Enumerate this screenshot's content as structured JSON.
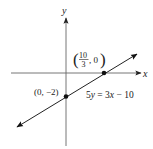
{
  "figure": {
    "type": "coordinate-plane-line-graph",
    "axes": {
      "x_label": "x",
      "y_label": "y"
    },
    "line": {
      "equation": "5y = 3x − 10",
      "equation_parts": {
        "lhs_coef": "5",
        "lhs_var": "y",
        "eq": " = ",
        "rhs_coef": "3",
        "rhs_var": "x",
        "rhs_rest": " − 10"
      },
      "slope": "3/5",
      "arrows": "both-ends"
    },
    "points": [
      {
        "name": "x-intercept",
        "label": "(10/3, 0)",
        "fraction_numerator": "10",
        "fraction_denominator": "3",
        "label_suffix": ", 0"
      },
      {
        "name": "y-intercept",
        "label": "(0, −2)"
      }
    ],
    "colors": {
      "axis": "#555555",
      "line": "#222222",
      "point": "#111111"
    }
  }
}
